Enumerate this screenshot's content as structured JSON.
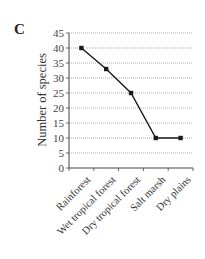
{
  "panel_label": "C",
  "chart_data": {
    "type": "line",
    "title": "",
    "xlabel": "",
    "ylabel": "Number of species",
    "categories": [
      "Rainforest",
      "Wet tropical forest",
      "Dry tropical forest",
      "Salt marsh",
      "Dry plains"
    ],
    "series": [
      {
        "name": "Number of species",
        "values": [
          40,
          33,
          25,
          10,
          10
        ]
      }
    ],
    "ylim": [
      0,
      45
    ],
    "yticks": [
      0,
      5,
      10,
      15,
      20,
      25,
      30,
      35,
      40,
      45
    ],
    "grid": "horizontal dotted",
    "legend": "none",
    "marker": "square",
    "line_color": "#1a1a1a"
  }
}
